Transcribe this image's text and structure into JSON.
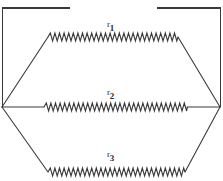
{
  "figure": {
    "type": "circuit-diagram",
    "background_color": "#ffffff",
    "line_color": "#3a3a3a",
    "text_color": "#2b2b2b",
    "width": 223,
    "height": 181,
    "frame": {
      "top_rule_left": {
        "x1": 2,
        "y1": 8,
        "x2": 70,
        "y2": 8
      },
      "top_rule_right": {
        "x1": 157,
        "y1": 8,
        "x2": 221,
        "y2": 8
      },
      "left_rule": {
        "x1": 2,
        "y1": 8,
        "x2": 2,
        "y2": 107
      },
      "right_rule": {
        "x1": 221,
        "y1": 8,
        "x2": 221,
        "y2": 107
      }
    },
    "nodes": {
      "left": {
        "x": 2,
        "y": 107
      },
      "right": {
        "x": 220,
        "y": 107
      }
    },
    "branches": [
      {
        "name": "top-branch",
        "label": "r1",
        "label_base": "r",
        "label_sub": "1",
        "resistor": {
          "x1": 48,
          "y1": 37,
          "x2": 178,
          "y2": 37,
          "amplitude": 4,
          "teeth": 28
        },
        "leads": [
          {
            "x1": 2,
            "y1": 107,
            "x2": 48,
            "y2": 37
          },
          {
            "x1": 178,
            "y1": 37,
            "x2": 220,
            "y2": 107
          }
        ]
      },
      {
        "name": "middle-branch",
        "label": "r2",
        "label_base": "r",
        "label_sub": "2",
        "resistor": {
          "x1": 43,
          "y1": 107,
          "x2": 188,
          "y2": 107,
          "amplitude": 4,
          "teeth": 30
        },
        "leads": [
          {
            "x1": 2,
            "y1": 107,
            "x2": 43,
            "y2": 107
          },
          {
            "x1": 188,
            "y1": 107,
            "x2": 220,
            "y2": 107
          }
        ]
      },
      {
        "name": "bottom-branch",
        "label": "r3",
        "label_base": "r",
        "label_sub": "3",
        "resistor": {
          "x1": 48,
          "y1": 172,
          "x2": 185,
          "y2": 172,
          "amplitude": 4,
          "teeth": 29
        },
        "leads": [
          {
            "x1": 2,
            "y1": 107,
            "x2": 48,
            "y2": 172
          },
          {
            "x1": 185,
            "y1": 172,
            "x2": 220,
            "y2": 107
          }
        ]
      }
    ],
    "labels": {
      "r1": {
        "base": "r",
        "sub": "1"
      },
      "r2": {
        "base": "r",
        "sub": "2"
      },
      "r3": {
        "base": "r",
        "sub": "3"
      }
    }
  }
}
